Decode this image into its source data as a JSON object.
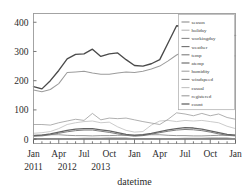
{
  "figure": {
    "faint_top_text": "",
    "background_color": "#ffffff",
    "frame_color": "#9a9a9a"
  },
  "axes": {
    "xlabel": "datetime",
    "ylabel": "",
    "ytick_labels": [
      "0",
      "100",
      "200",
      "300",
      "400"
    ],
    "ytick_values": [
      0,
      100,
      200,
      300,
      400
    ],
    "xtick_labels": [
      "Jan",
      "Apr",
      "Jul",
      "Oct",
      "Jan",
      "Apr",
      "Jul",
      "Oct",
      "Jan"
    ],
    "xyear_labels": [
      {
        "text": "2011",
        "at_index": 0
      },
      {
        "text": "2012",
        "at_index": 4
      },
      {
        "text": "2013",
        "at_index": 8
      }
    ]
  },
  "legend": {
    "position": "upper right",
    "entries": [
      {
        "label": "season",
        "color": "#8f8f8f"
      },
      {
        "label": "holiday",
        "color": "#b5b5b5"
      },
      {
        "label": "workingday",
        "color": "#8a8a8a"
      },
      {
        "label": "weather",
        "color": "#6f6f6f"
      },
      {
        "label": "temp",
        "color": "#7d7d7d"
      },
      {
        "label": "atemp",
        "color": "#636363"
      },
      {
        "label": "humidity",
        "color": "#a2a2a2"
      },
      {
        "label": "windspeed",
        "color": "#8b8b8b"
      },
      {
        "label": "casual",
        "color": "#c2c2c2"
      },
      {
        "label": "registered",
        "color": "#9c9c9c"
      },
      {
        "label": "count",
        "color": "#4a4a4a"
      }
    ]
  },
  "chart_data": {
    "type": "line",
    "title": "",
    "xlabel": "datetime",
    "ylabel": "",
    "xlim": [
      0,
      24
    ],
    "ylim": [
      -15,
      430
    ],
    "grid": false,
    "legend_position": "upper right",
    "x": [
      "2011-01",
      "2011-02",
      "2011-03",
      "2011-04",
      "2011-05",
      "2011-06",
      "2011-07",
      "2011-08",
      "2011-09",
      "2011-10",
      "2011-11",
      "2011-12",
      "2012-01",
      "2012-02",
      "2012-03",
      "2012-04",
      "2012-05",
      "2012-06",
      "2012-07",
      "2012-08",
      "2012-09",
      "2012-10",
      "2012-11",
      "2012-12",
      "2013-01"
    ],
    "series": [
      {
        "name": "count",
        "color": "#4a4a4a",
        "values": [
          180,
          172,
          200,
          235,
          275,
          290,
          292,
          308,
          283,
          292,
          295,
          272,
          252,
          250,
          258,
          272,
          330,
          388,
          385,
          400,
          412,
          368,
          355,
          352,
          355
        ]
      },
      {
        "name": "registered",
        "color": "#9c9c9c",
        "values": [
          168,
          162,
          170,
          190,
          228,
          230,
          232,
          226,
          222,
          222,
          226,
          230,
          228,
          232,
          240,
          250,
          268,
          288,
          302,
          310,
          320,
          300,
          288,
          285,
          285
        ]
      },
      {
        "name": "humidity",
        "color": "#a2a2a2",
        "values": [
          50,
          50,
          48,
          56,
          62,
          68,
          64,
          88,
          66,
          72,
          70,
          72,
          66,
          60,
          55,
          50,
          68,
          90,
          86,
          80,
          88,
          80,
          86,
          74,
          68
        ]
      },
      {
        "name": "casual",
        "color": "#c2c2c2",
        "values": [
          20,
          22,
          26,
          36,
          50,
          56,
          60,
          62,
          56,
          58,
          42,
          30,
          24,
          26,
          48,
          62,
          64,
          60,
          64,
          62,
          64,
          60,
          56,
          44,
          36
        ]
      },
      {
        "name": "atemp",
        "color": "#636363",
        "values": [
          12,
          14,
          18,
          24,
          30,
          34,
          36,
          36,
          32,
          28,
          22,
          16,
          13,
          15,
          20,
          26,
          32,
          36,
          39,
          38,
          34,
          28,
          22,
          16,
          14
        ]
      },
      {
        "name": "temp",
        "color": "#7d7d7d",
        "values": [
          10,
          11,
          15,
          20,
          25,
          29,
          31,
          31,
          27,
          23,
          18,
          13,
          10,
          12,
          17,
          22,
          27,
          31,
          33,
          32,
          29,
          24,
          18,
          13,
          11
        ]
      },
      {
        "name": "windspeed",
        "color": "#8b8b8b",
        "values": [
          13,
          14,
          15,
          15,
          13,
          12,
          12,
          11,
          12,
          12,
          13,
          13,
          14,
          14,
          15,
          15,
          13,
          12,
          12,
          11,
          11,
          12,
          13,
          13,
          13
        ]
      },
      {
        "name": "season",
        "color": "#8f8f8f",
        "values": [
          1,
          1,
          1,
          2,
          2,
          2,
          3,
          3,
          3,
          4,
          4,
          4,
          1,
          1,
          1,
          2,
          2,
          2,
          3,
          3,
          3,
          4,
          4,
          4,
          1
        ]
      },
      {
        "name": "weather",
        "color": "#6f6f6f",
        "values": [
          1,
          1,
          1,
          1,
          1,
          1,
          1,
          1,
          1,
          1,
          1,
          1,
          1,
          1,
          1,
          1,
          1,
          1,
          1,
          1,
          1,
          1,
          1,
          1,
          1
        ]
      },
      {
        "name": "workingday",
        "color": "#8a8a8a",
        "values": [
          0.7,
          0.7,
          0.7,
          0.7,
          0.7,
          0.7,
          0.7,
          0.7,
          0.7,
          0.7,
          0.7,
          0.7,
          0.7,
          0.7,
          0.7,
          0.7,
          0.7,
          0.7,
          0.7,
          0.7,
          0.7,
          0.7,
          0.7,
          0.7,
          0.7
        ]
      },
      {
        "name": "holiday",
        "color": "#b5b5b5",
        "values": [
          0,
          0,
          0,
          0,
          0,
          0,
          0,
          0,
          0,
          0,
          0,
          0,
          0,
          0,
          0,
          0,
          0,
          0,
          0,
          0,
          0,
          0,
          0,
          0,
          0
        ]
      }
    ]
  }
}
